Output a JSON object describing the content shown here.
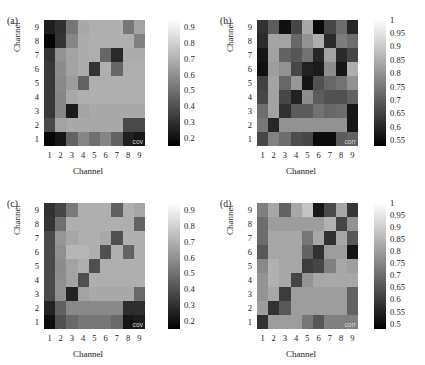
{
  "figure": {
    "axis_label_x": "Channel",
    "axis_label_y": "Channel",
    "tick_labels_x": [
      "1",
      "2",
      "3",
      "4",
      "5",
      "6",
      "7",
      "8",
      "9"
    ],
    "tick_labels_y": [
      "9",
      "8",
      "7",
      "6",
      "5",
      "4",
      "3",
      "2",
      "1"
    ],
    "colormap": "gray",
    "colors": {
      "low": "#000000",
      "high": "#ffffff"
    }
  },
  "panels": [
    {
      "tag": "(a)",
      "corner_tag": "cov",
      "cbar_labels": [
        "0.9",
        "0.8",
        "0.7",
        "0.6",
        "0.5",
        "0.4",
        "0.3",
        "0.2"
      ],
      "cbar_values": [
        0.9,
        0.8,
        0.7,
        0.6,
        0.5,
        0.4,
        0.3,
        0.2
      ]
    },
    {
      "tag": "(b)",
      "corner_tag": "corr",
      "cbar_labels": [
        "1",
        "0.95",
        "0.9",
        "0.85",
        "0.8",
        "0.75",
        "0.7",
        "0.65",
        "0.6",
        "0.55"
      ],
      "cbar_values": [
        1,
        0.95,
        0.9,
        0.85,
        0.8,
        0.75,
        0.7,
        0.65,
        0.6,
        0.55
      ]
    },
    {
      "tag": "(c)",
      "corner_tag": "cov",
      "cbar_labels": [
        "0.9",
        "0.8",
        "0.7",
        "0.6",
        "0.5",
        "0.4",
        "0.3",
        "0.2"
      ],
      "cbar_values": [
        0.9,
        0.8,
        0.7,
        0.6,
        0.5,
        0.4,
        0.3,
        0.2
      ]
    },
    {
      "tag": "(d)",
      "corner_tag": "corr",
      "cbar_labels": [
        "1",
        "0.95",
        "0.9",
        "0.85",
        "0.8",
        "0.75",
        "0.7",
        "0.65",
        "0.6",
        "0.55",
        "0.5"
      ],
      "cbar_values": [
        1,
        0.95,
        0.9,
        0.85,
        0.8,
        0.75,
        0.7,
        0.65,
        0.6,
        0.55,
        0.5
      ]
    }
  ],
  "chart_data": [
    {
      "type": "heatmap",
      "panel": "a",
      "title": "(a) cov",
      "xlabel": "Channel",
      "ylabel": "Channel",
      "x": [
        1,
        2,
        3,
        4,
        5,
        6,
        7,
        8,
        9
      ],
      "y": [
        1,
        2,
        3,
        4,
        5,
        6,
        7,
        8,
        9
      ],
      "zlim": [
        0.15,
        0.95
      ],
      "cbar_ticks": [
        0.2,
        0.3,
        0.4,
        0.5,
        0.6,
        0.7,
        0.8,
        0.9
      ],
      "grid": false,
      "row_order": "top row is Channel 9, bottom row is Channel 1",
      "values": [
        [
          0.24,
          0.3,
          0.52,
          0.68,
          0.7,
          0.7,
          0.7,
          0.52,
          0.66
        ],
        [
          0.17,
          0.31,
          0.57,
          0.69,
          0.7,
          0.7,
          0.7,
          0.7,
          0.55
        ],
        [
          0.31,
          0.61,
          0.66,
          0.69,
          0.7,
          0.47,
          0.28,
          0.69,
          0.69
        ],
        [
          0.33,
          0.59,
          0.66,
          0.69,
          0.31,
          0.7,
          0.47,
          0.7,
          0.7
        ],
        [
          0.33,
          0.58,
          0.64,
          0.46,
          0.7,
          0.7,
          0.7,
          0.7,
          0.7
        ],
        [
          0.33,
          0.57,
          0.68,
          0.7,
          0.7,
          0.7,
          0.7,
          0.7,
          0.7
        ],
        [
          0.33,
          0.57,
          0.23,
          0.66,
          0.68,
          0.68,
          0.68,
          0.68,
          0.68
        ],
        [
          0.38,
          0.66,
          0.68,
          0.68,
          0.68,
          0.68,
          0.68,
          0.38,
          0.38
        ],
        [
          0.17,
          0.22,
          0.46,
          0.57,
          0.5,
          0.57,
          0.46,
          0.25,
          0.22
        ]
      ]
    },
    {
      "type": "heatmap",
      "panel": "b",
      "title": "(b) corr",
      "xlabel": "Channel",
      "ylabel": "Channel",
      "x": [
        1,
        2,
        3,
        4,
        5,
        6,
        7,
        8,
        9
      ],
      "y": [
        1,
        2,
        3,
        4,
        5,
        6,
        7,
        8,
        9
      ],
      "zlim": [
        0.53,
        1.0
      ],
      "cbar_ticks": [
        0.55,
        0.6,
        0.65,
        0.7,
        0.75,
        0.8,
        0.85,
        0.9,
        0.95,
        1.0
      ],
      "grid": false,
      "row_order": "top row is Channel 9, bottom row is Channel 1",
      "values": [
        [
          0.62,
          0.7,
          0.56,
          0.66,
          0.84,
          0.55,
          0.66,
          0.73,
          0.6
        ],
        [
          0.61,
          0.83,
          0.83,
          0.72,
          0.8,
          0.85,
          0.61,
          0.76,
          0.73
        ],
        [
          0.57,
          0.83,
          0.71,
          0.69,
          0.74,
          0.6,
          0.83,
          0.61,
          0.66
        ],
        [
          0.56,
          0.82,
          0.8,
          0.66,
          0.59,
          0.58,
          0.79,
          0.57,
          0.85
        ],
        [
          0.65,
          0.83,
          0.72,
          0.81,
          0.57,
          0.68,
          0.72,
          0.74,
          0.8
        ],
        [
          0.66,
          0.83,
          0.66,
          0.59,
          0.79,
          0.7,
          0.68,
          0.68,
          0.71
        ],
        [
          0.73,
          0.83,
          0.62,
          0.7,
          0.7,
          0.74,
          0.72,
          0.73,
          0.57
        ],
        [
          0.75,
          0.6,
          0.8,
          0.8,
          0.8,
          0.8,
          0.8,
          0.8,
          0.57
        ],
        [
          0.66,
          0.77,
          0.73,
          0.67,
          0.66,
          0.55,
          0.55,
          0.7,
          0.71
        ]
      ]
    },
    {
      "type": "heatmap",
      "panel": "c",
      "title": "(c) cov",
      "xlabel": "Channel",
      "ylabel": "Channel",
      "x": [
        1,
        2,
        3,
        4,
        5,
        6,
        7,
        8,
        9
      ],
      "y": [
        1,
        2,
        3,
        4,
        5,
        6,
        7,
        8,
        9
      ],
      "zlim": [
        0.15,
        0.95
      ],
      "cbar_ticks": [
        0.2,
        0.3,
        0.4,
        0.5,
        0.6,
        0.7,
        0.8,
        0.9
      ],
      "grid": false,
      "row_order": "top row is Channel 9, bottom row is Channel 1",
      "values": [
        [
          0.3,
          0.37,
          0.53,
          0.7,
          0.7,
          0.7,
          0.45,
          0.7,
          0.67
        ],
        [
          0.31,
          0.5,
          0.7,
          0.7,
          0.7,
          0.7,
          0.7,
          0.7,
          0.46
        ],
        [
          0.38,
          0.62,
          0.67,
          0.7,
          0.7,
          0.68,
          0.4,
          0.7,
          0.7
        ],
        [
          0.38,
          0.6,
          0.72,
          0.72,
          0.7,
          0.4,
          0.7,
          0.46,
          0.7
        ],
        [
          0.38,
          0.59,
          0.66,
          0.7,
          0.4,
          0.7,
          0.7,
          0.7,
          0.7
        ],
        [
          0.38,
          0.6,
          0.66,
          0.4,
          0.7,
          0.7,
          0.7,
          0.7,
          0.7
        ],
        [
          0.38,
          0.6,
          0.26,
          0.66,
          0.68,
          0.68,
          0.68,
          0.68,
          0.48
        ],
        [
          0.26,
          0.45,
          0.58,
          0.58,
          0.58,
          0.58,
          0.58,
          0.29,
          0.29
        ],
        [
          0.19,
          0.4,
          0.48,
          0.52,
          0.52,
          0.52,
          0.48,
          0.22,
          0.24
        ]
      ]
    },
    {
      "type": "heatmap",
      "panel": "d",
      "title": "(d) corr",
      "xlabel": "Channel",
      "ylabel": "Channel",
      "x": [
        1,
        2,
        3,
        4,
        5,
        6,
        7,
        8,
        9
      ],
      "y": [
        1,
        2,
        3,
        4,
        5,
        6,
        7,
        8,
        9
      ],
      "zlim": [
        0.48,
        1.0
      ],
      "cbar_ticks": [
        0.5,
        0.55,
        0.6,
        0.65,
        0.7,
        0.75,
        0.8,
        0.85,
        0.9,
        0.95,
        1.0
      ],
      "grid": false,
      "row_order": "top row is Channel 9, bottom row is Channel 1",
      "values": [
        [
          0.74,
          0.82,
          0.68,
          0.82,
          0.88,
          0.53,
          0.63,
          0.82,
          0.59
        ],
        [
          0.7,
          0.8,
          0.8,
          0.8,
          0.8,
          0.8,
          0.84,
          0.62,
          0.78
        ],
        [
          0.7,
          0.82,
          0.82,
          0.82,
          0.72,
          0.82,
          0.58,
          0.82,
          0.66
        ],
        [
          0.66,
          0.82,
          0.82,
          0.82,
          0.68,
          0.58,
          0.8,
          0.8,
          0.52
        ],
        [
          0.76,
          0.84,
          0.82,
          0.82,
          0.6,
          0.62,
          0.74,
          0.82,
          0.8
        ],
        [
          0.78,
          0.84,
          0.82,
          0.62,
          0.78,
          0.82,
          0.82,
          0.82,
          0.82
        ],
        [
          0.78,
          0.82,
          0.6,
          0.8,
          0.8,
          0.8,
          0.8,
          0.8,
          0.68
        ],
        [
          0.8,
          0.58,
          0.66,
          0.8,
          0.8,
          0.8,
          0.8,
          0.8,
          0.68
        ],
        [
          0.58,
          0.8,
          0.8,
          0.8,
          0.72,
          0.66,
          0.74,
          0.74,
          0.74
        ]
      ]
    }
  ]
}
